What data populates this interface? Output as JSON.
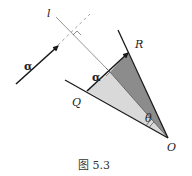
{
  "figure": {
    "caption": "图 5.3",
    "labels": {
      "line_l": "l",
      "alpha_free": "α",
      "alpha_on_segment": "α",
      "point_R": "R",
      "point_Q": "Q",
      "point_O": "O",
      "angle_theta": "θ"
    },
    "colors": {
      "dark_shade": "#8c8c8c",
      "light_shade": "#d9d9d9",
      "stroke": "#1a1a1a",
      "thin_line": "#555555"
    }
  }
}
